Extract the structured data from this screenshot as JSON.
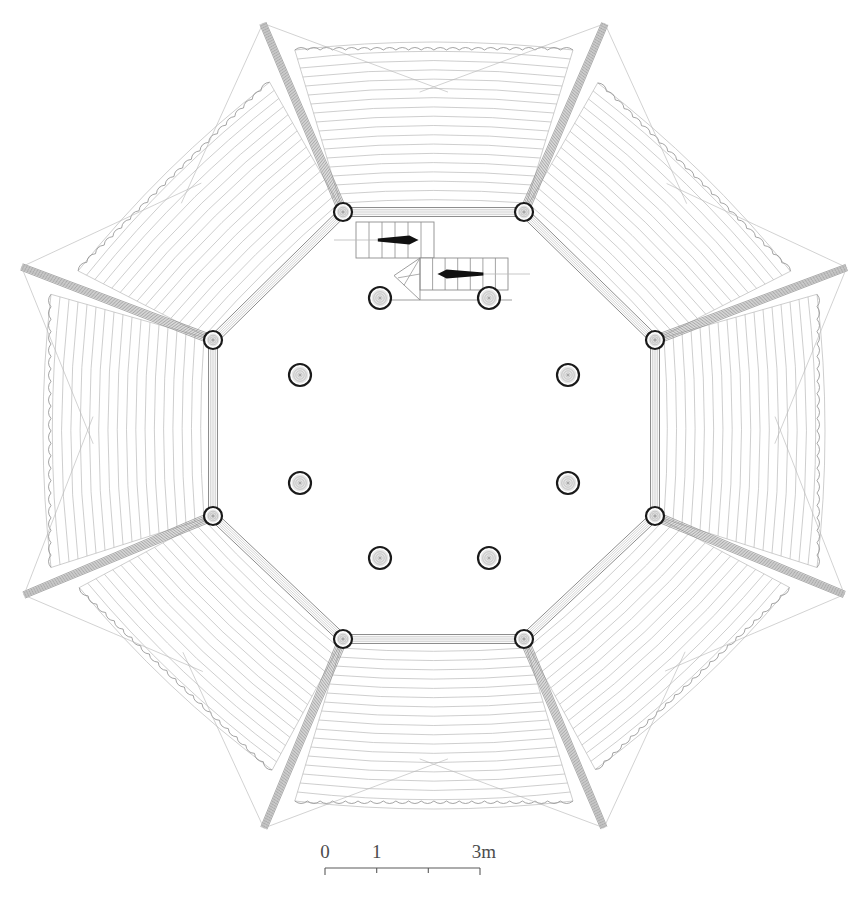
{
  "drawing": {
    "title": "Octagonal pavilion roof plan",
    "type": "architectural-floor-plan",
    "background_color": "#ffffff",
    "line_color_light": "#b9b9b9",
    "line_color_mid": "#8d8d8d",
    "line_color_dark": "#1a1a1a",
    "canvas": {
      "width": 864,
      "height": 919
    }
  },
  "scale_bar": {
    "label_start": "0",
    "label_mid": "1",
    "label_end": "3m",
    "tick_values": [
      "0",
      "1",
      "2",
      "3"
    ],
    "bar_x_start": 325,
    "bar_x_end": 480,
    "bar_y": 868,
    "units": "m"
  },
  "plan": {
    "center": {
      "x": 433,
      "y": 424
    },
    "octagon_vertices": [
      {
        "id": "v-n-left",
        "x": 343,
        "y": 212
      },
      {
        "id": "v-n-right",
        "x": 524,
        "y": 212
      },
      {
        "id": "v-e-upper",
        "x": 655,
        "y": 340
      },
      {
        "id": "v-e-lower",
        "x": 655,
        "y": 516
      },
      {
        "id": "v-s-right",
        "x": 524,
        "y": 639
      },
      {
        "id": "v-s-left",
        "x": 343,
        "y": 639
      },
      {
        "id": "v-w-lower",
        "x": 213,
        "y": 516
      },
      {
        "id": "v-w-upper",
        "x": 213,
        "y": 340
      }
    ],
    "corner_column_radius": 9,
    "interior_columns": [
      {
        "id": "col-nw",
        "x": 380,
        "y": 298,
        "r": 11
      },
      {
        "id": "col-ne",
        "x": 489,
        "y": 298,
        "r": 11
      },
      {
        "id": "col-wn",
        "x": 300,
        "y": 375,
        "r": 11
      },
      {
        "id": "col-en",
        "x": 568,
        "y": 375,
        "r": 11
      },
      {
        "id": "col-ws",
        "x": 300,
        "y": 483,
        "r": 11
      },
      {
        "id": "col-es",
        "x": 568,
        "y": 483,
        "r": 11
      },
      {
        "id": "col-sw",
        "x": 380,
        "y": 558,
        "r": 11
      },
      {
        "id": "col-se",
        "x": 489,
        "y": 558,
        "r": 11
      }
    ],
    "stairs": [
      {
        "id": "stair-upper",
        "label": "stair-run-up",
        "direction": "right",
        "x": 356,
        "y": 222,
        "width": 78,
        "height": 36,
        "riser_count": 6
      },
      {
        "id": "stair-lower",
        "label": "stair-run-down",
        "direction": "left",
        "x": 420,
        "y": 258,
        "width": 88,
        "height": 32,
        "riser_count": 7,
        "has_winder": true
      }
    ],
    "canopy": {
      "petal_count": 8,
      "rib_spacing": 9,
      "mast_count": 8,
      "description": "fanned fabric canopy petals radiating from each octagon vertex with scalloped outer edges"
    }
  }
}
